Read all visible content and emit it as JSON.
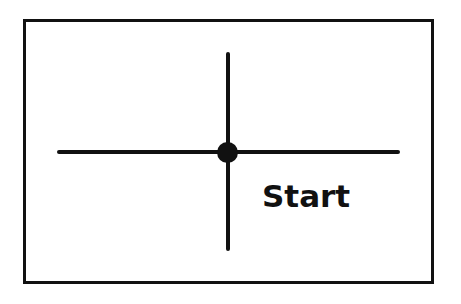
{
  "diagram": {
    "label": "Start",
    "elements": [
      {
        "type": "frame"
      },
      {
        "type": "horizontal-line"
      },
      {
        "type": "vertical-line"
      },
      {
        "type": "origin-dot"
      }
    ],
    "colors": {
      "stroke": "#111111",
      "background": "#ffffff"
    }
  }
}
